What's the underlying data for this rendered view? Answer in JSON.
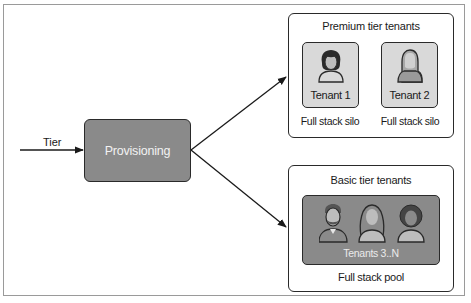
{
  "diagram": {
    "input_label": "Tier",
    "process": {
      "label": "Provisioning"
    },
    "groups": [
      {
        "title": "Premium tier tenants",
        "tenants": [
          {
            "label": "Tenant 1",
            "caption": "Full stack silo",
            "icon": "woman-avatar-icon"
          },
          {
            "label": "Tenant 2",
            "caption": "Full stack silo",
            "icon": "hooded-person-avatar-icon"
          }
        ]
      },
      {
        "title": "Basic tier tenants",
        "pool": {
          "label": "Tenants 3..N",
          "caption": "Full stack pool",
          "icons": [
            "bearded-man-avatar-icon",
            "long-hair-woman-avatar-icon",
            "curly-hair-person-avatar-icon"
          ]
        }
      }
    ],
    "colors": {
      "process_fill": "#8a8a8a",
      "tenant_fill": "#d9d9d9",
      "pool_fill": "#8a8a8a",
      "stroke": "#2a2a2a"
    }
  }
}
